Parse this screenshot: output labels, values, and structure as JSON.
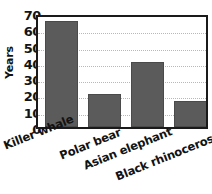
{
  "chart_data": {
    "type": "bar",
    "title": "",
    "xlabel": "",
    "ylabel": "Years",
    "categories": [
      "Killer whale",
      "Polar bear",
      "Asian elephant",
      "Black rhinoceros"
    ],
    "values": [
      65,
      20,
      40,
      16
    ],
    "ylim": [
      0,
      70
    ],
    "ytick_labels": [
      "70",
      "60",
      "50",
      "40",
      "30",
      "20",
      "10",
      "0"
    ],
    "ytick_values": [
      70,
      60,
      50,
      40,
      30,
      20,
      10,
      0
    ],
    "ytick_interval": 10,
    "grid": true,
    "grid_axis": "y",
    "grid_style": "dotted",
    "legend": false,
    "legend_position": "none",
    "bar_color": "#5b5b5b",
    "grid_color": "#b8b8b8",
    "axis_color": "#1a1a1a",
    "text_color": "#121212",
    "background_color": "#ffffff",
    "xtick_label_rotation": -22
  }
}
